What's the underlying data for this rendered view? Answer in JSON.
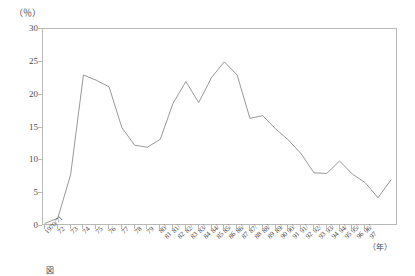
{
  "chart_data": {
    "type": "line",
    "title": "",
    "xlabel": "(年)",
    "ylabel": "(％)",
    "ylim": [
      0,
      30
    ],
    "yticks": [
      0,
      5,
      10,
      15,
      20,
      25,
      30
    ],
    "ytick_labels": [
      "0",
      "5",
      "10",
      "15",
      "20",
      "25",
      "30"
    ],
    "grid": false,
    "legend": "none",
    "categories": [
      "1970/71",
      "72",
      "73",
      "74",
      "75",
      "76",
      "77",
      "78",
      "79",
      "80/81",
      "81/82",
      "82/83",
      "83/84",
      "84/85",
      "85/86",
      "86/87",
      "87/88",
      "88/89",
      "89/90",
      "90/91",
      "91/92",
      "92/93",
      "93/94",
      "94/95",
      "95/96",
      "96/97"
    ],
    "xtick_labels_display": [
      "1970/71",
      "72",
      "73",
      "74",
      "75",
      "76",
      "77",
      "78",
      "79",
      "80/\n81",
      "81/\n82",
      "82/\n83",
      "83/\n84",
      "84/\n85",
      "85/\n86",
      "86/\n87",
      "87/\n88",
      "88/\n89",
      "89/\n90",
      "90/\n91",
      "91/\n92",
      "92/\n93",
      "93/\n94",
      "94/\n95",
      "95/\n96",
      "96/\n97"
    ],
    "values": [
      0.4,
      1.2,
      7.8,
      23.0,
      22.2,
      21.2,
      15.0,
      12.3,
      12.0,
      13.2,
      18.7,
      22.0,
      18.8,
      22.6,
      25.0,
      23.0,
      16.4,
      16.8,
      14.8,
      13.1,
      11.0,
      8.1,
      8.0,
      9.9,
      7.9,
      6.6
    ],
    "series": [
      {
        "name": "",
        "color": "#8c8c8c",
        "values": [
          0.4,
          1.2,
          7.8,
          23.0,
          22.2,
          21.2,
          15.0,
          12.3,
          12.0,
          13.2,
          18.7,
          22.0,
          18.8,
          22.6,
          25.0,
          23.0,
          16.4,
          16.8,
          14.8,
          13.1,
          11.0,
          8.1,
          8.0,
          9.9,
          7.9,
          6.6
        ]
      }
    ],
    "extra_points": {
      "tail_x": "96/97",
      "tail_values": [
        4.3,
        7.0
      ]
    },
    "line_color": "#8c8c8c",
    "frame_color": "#b9b9b9"
  },
  "axes": {
    "y_unit_label": "（％）",
    "x_unit_label": "（年）"
  },
  "caption": {
    "marker": "図",
    "text": "  　　　　　　　　　　　　　　　　　　　　　　　　　　　　"
  }
}
